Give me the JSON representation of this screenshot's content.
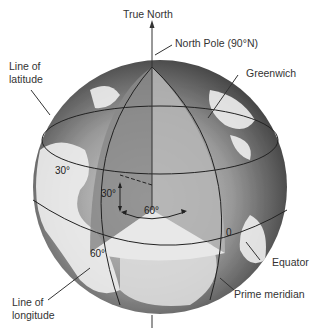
{
  "diagram": {
    "labels": {
      "true_north": "True North",
      "north_pole": "North Pole (90°N)",
      "line_of_latitude_1": "Line of",
      "line_of_latitude_2": "latitude",
      "greenwich": "Greenwich",
      "equator": "Equator",
      "prime_meridian": "Prime meridian",
      "line_of_longitude_1": "Line of",
      "line_of_longitude_2": "longitude"
    },
    "angles": {
      "lat_30_left": "30°",
      "lat_30_inner": "30°",
      "lon_60_inner": "60°",
      "lon_60_equator": "60°",
      "zero": "0"
    },
    "colors": {
      "ocean_dark": "#5a5a5a",
      "ocean_light": "#c8c8c8",
      "land": "#f0f0f0",
      "wedge_dark": "#8a8a8a",
      "wedge_mid": "#b0b0b0",
      "wedge_light": "#e6e6e6",
      "line": "#222222"
    }
  }
}
